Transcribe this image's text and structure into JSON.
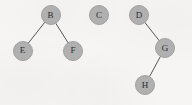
{
  "canvas": {
    "width": 192,
    "height": 105,
    "background_color": "#f7f5f4"
  },
  "style": {
    "node_fill": "#b0b0b0",
    "node_stroke": "#a0a0a0",
    "node_diameter": 20,
    "node_label_color": "#2b2b2b",
    "node_label_font_size": 9,
    "edge_color": "#55555a",
    "edge_width": 1
  },
  "chart_data": {
    "type": "diagram",
    "diagram_type": "node-link-graph",
    "title": "",
    "directed": false,
    "nodes": [
      {
        "id": "B",
        "label": "B",
        "x": 50.5,
        "y": 15.0
      },
      {
        "id": "C",
        "label": "C",
        "x": 99.0,
        "y": 15.0
      },
      {
        "id": "D",
        "label": "D",
        "x": 139.0,
        "y": 15.0
      },
      {
        "id": "E",
        "label": "E",
        "x": 22.5,
        "y": 50.5
      },
      {
        "id": "F",
        "label": "F",
        "x": 73.0,
        "y": 50.5
      },
      {
        "id": "G",
        "label": "G",
        "x": 165.0,
        "y": 48.0
      },
      {
        "id": "H",
        "label": "H",
        "x": 145.0,
        "y": 85.0
      }
    ],
    "edges": [
      {
        "source": "B",
        "target": "E"
      },
      {
        "source": "B",
        "target": "F"
      },
      {
        "source": "D",
        "target": "G"
      },
      {
        "source": "G",
        "target": "H"
      }
    ],
    "isolated_nodes": [
      "C"
    ],
    "components": [
      [
        "B",
        "E",
        "F"
      ],
      [
        "C"
      ],
      [
        "D",
        "G",
        "H"
      ]
    ]
  }
}
